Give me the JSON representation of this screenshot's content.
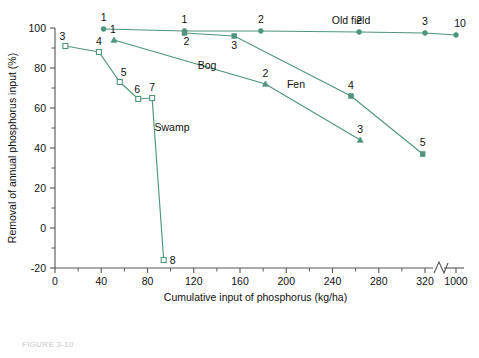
{
  "chart_data": {
    "type": "line",
    "title": "",
    "xlabel": "Cumulative input of phosphorus (kg/ha)",
    "ylabel": "Removal of annual phosphorus input (%)",
    "xlim": [
      0,
      340
    ],
    "ylim": [
      -20,
      100
    ],
    "grid": false,
    "legend": "inline-labels",
    "x_ticks": [
      "0",
      "40",
      "80",
      "120",
      "160",
      "200",
      "240",
      "280",
      "320",
      "1000"
    ],
    "x_tick_values": [
      0,
      40,
      80,
      120,
      160,
      200,
      240,
      280,
      320,
      1000
    ],
    "x_axis_break": {
      "after": 320,
      "before": 1000,
      "note": "axis break"
    },
    "y_ticks": [
      "-20",
      "0",
      "20",
      "40",
      "60",
      "80",
      "100"
    ],
    "y_tick_values": [
      -20,
      0,
      20,
      40,
      60,
      80,
      100
    ],
    "y_minor_step": 10,
    "series": [
      {
        "name": "Old field",
        "marker": "filled-circle",
        "label": "Old field",
        "points": [
          {
            "x": 42,
            "y": 99.5,
            "label": "1"
          },
          {
            "x": 112,
            "y": 98.5,
            "label": "1"
          },
          {
            "x": 178,
            "y": 98.5,
            "label": "2"
          },
          {
            "x": 263,
            "y": 98.0,
            "label": "2"
          },
          {
            "x": 320,
            "y": 97.5,
            "label": "3"
          },
          {
            "x": 1000,
            "y": 96.5,
            "label": "10"
          }
        ]
      },
      {
        "name": "Fen",
        "marker": "filled-square",
        "label": "Fen",
        "points": [
          {
            "x": 112,
            "y": 97.5,
            "label": "2"
          },
          {
            "x": 155,
            "y": 96.0,
            "label": "3"
          },
          {
            "x": 256,
            "y": 66.0,
            "label": "4"
          },
          {
            "x": 318,
            "y": 37.0,
            "label": "5"
          }
        ]
      },
      {
        "name": "Bog",
        "marker": "filled-triangle",
        "label": "Bog",
        "points": [
          {
            "x": 51,
            "y": 94.0,
            "label": "1"
          },
          {
            "x": 182,
            "y": 72.0,
            "label": "2"
          },
          {
            "x": 264,
            "y": 44.0,
            "label": "3"
          }
        ]
      },
      {
        "name": "Swamp",
        "marker": "open-square",
        "label": "Swamp",
        "points": [
          {
            "x": 9,
            "y": 91.0,
            "label": "3"
          },
          {
            "x": 38,
            "y": 88.0,
            "label": "4"
          },
          {
            "x": 56,
            "y": 73.0,
            "label": "5"
          },
          {
            "x": 72,
            "y": 64.5,
            "label": "6"
          },
          {
            "x": 84,
            "y": 65.0,
            "label": "7"
          },
          {
            "x": 94,
            "y": -16.0,
            "label": "8"
          }
        ]
      }
    ]
  },
  "caption": "FIGURE 3-10"
}
